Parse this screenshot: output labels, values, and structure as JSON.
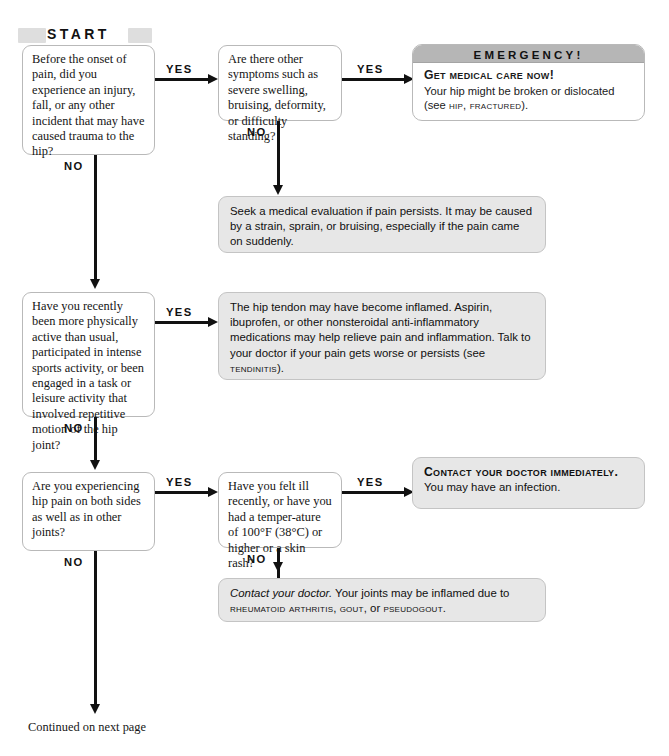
{
  "chart": {
    "start_label": "START",
    "footer_note": "Continued on next page"
  },
  "edge_labels": {
    "yes": "YES",
    "no": "NO"
  },
  "questions": [
    {
      "id": "q1",
      "text": "Before the onset of pain, did you experience an injury, fall, or any other incident that may have caused trauma to the hip?"
    },
    {
      "id": "q2",
      "text": "Are there other symptoms such as severe swelling, bruising, deformity, or difficulty standing?"
    },
    {
      "id": "q3",
      "text": "Have you recently been more physically active than usual, participated in intense sports activity, or been engaged in a task or leisure activity that involved repetitive motion of the hip joint?"
    },
    {
      "id": "q4",
      "text": "Are you experiencing hip pain on both sides as well as in other joints?"
    },
    {
      "id": "q5",
      "text": "Have you felt ill recently, or have you had a temper-ature of 100°F (38°C) or higher or a skin rash?"
    }
  ],
  "emergency": {
    "banner": "EMERGENCY!",
    "headline": "Get medical care now!",
    "body_prefix": "Your hip might be broken or dislocated (see ",
    "body_refs": "hip, fractured",
    "body_suffix": ")."
  },
  "answers": {
    "a1": "Seek a medical evaluation if pain persists. It may be caused by a strain, sprain, or bruising, especially if the pain came on suddenly.",
    "a2_prefix": "The hip tendon may have become inflamed. Aspirin, ibuprofen, or other nonsteroidal anti-inflammatory medications may help relieve pain and inflammation. Talk to your doctor if your pain gets worse or persists (see ",
    "a2_ref": "tendinitis",
    "a2_suffix": ").",
    "a3_bold": "Contact your doctor immediately.",
    "a3_rest": " You may have an infection.",
    "a4_italic": "Contact your doctor.",
    "a4_mid": " Your joints may be inflamed due to ",
    "a4_refs_1": "rheumatoid arthritis",
    "a4_sep1": ", ",
    "a4_refs_2": "gout",
    "a4_sep2": ", or ",
    "a4_refs_3": "pseudogout",
    "a4_end": "."
  },
  "colors": {
    "box_fill": "#e7e7e7",
    "box_border": "#b9b9b9",
    "banner_gray": "#b6b6b6",
    "start_band": "#dedede",
    "line": "#111111"
  }
}
